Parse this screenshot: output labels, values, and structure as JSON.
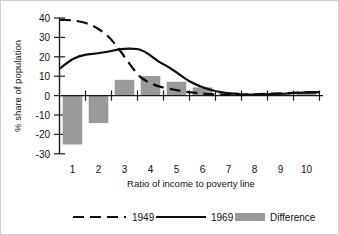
{
  "chart_data": {
    "type": "bar",
    "title": "",
    "xlabel": "Ratio of income to poverty line",
    "ylabel": "% share of population",
    "categories": [
      "1",
      "2",
      "3",
      "4",
      "5",
      "6",
      "7",
      "8",
      "9",
      "10"
    ],
    "x": [
      1,
      2,
      3,
      4,
      5,
      6,
      7,
      8,
      9,
      10
    ],
    "ylim": [
      -30,
      40
    ],
    "yticks": [
      -30,
      -20,
      -10,
      0,
      10,
      20,
      30,
      40
    ],
    "ytick_labels": [
      "-30",
      "-20",
      "-10",
      "0",
      "10",
      "20",
      "30",
      "40"
    ],
    "xtick_labels": [
      "1",
      "2",
      "3",
      "4",
      "5",
      "6",
      "7",
      "8",
      "9",
      "10"
    ],
    "grid": false,
    "legend_position": "bottom",
    "series": [
      {
        "name": "1949",
        "type": "line",
        "style": "dashed",
        "values": [
          39,
          38,
          30,
          10,
          6,
          4,
          2,
          1,
          1,
          2
        ]
      },
      {
        "name": "1969",
        "type": "line",
        "style": "solid",
        "values": [
          14,
          21,
          23,
          24,
          18,
          11,
          6,
          3,
          1.5,
          2
        ]
      },
      {
        "name": "Difference",
        "type": "bar",
        "style": "filled",
        "values": [
          -25,
          -14,
          8,
          10,
          7,
          4,
          1.5,
          0.5,
          0.5,
          2
        ]
      }
    ],
    "colors": {
      "bar_fill": "#9a9a9a",
      "line_1949": "#0d0d0d",
      "line_1969": "#0d0d0d",
      "axis": "#1a1a1a",
      "background": "#ffffff"
    }
  },
  "legend": {
    "entries": [
      {
        "label": "1949",
        "swatch": "dashed-line-swatch"
      },
      {
        "label": "1969",
        "swatch": "solid-line-swatch"
      },
      {
        "label": "Difference",
        "swatch": "gray-bar-swatch"
      }
    ]
  }
}
